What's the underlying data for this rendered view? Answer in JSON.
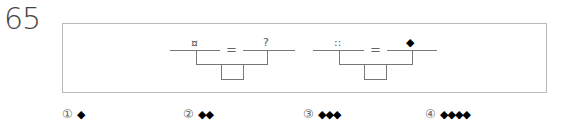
{
  "question": {
    "number": "65"
  },
  "diagrams": [
    {
      "left_symbol": "¤",
      "equals": "=",
      "right_symbol": "?"
    },
    {
      "left_symbol": "::",
      "equals": "=",
      "right_symbol": "◆"
    }
  ],
  "options": [
    {
      "marker": "①",
      "value": "◆"
    },
    {
      "marker": "②",
      "value": "◆◆"
    },
    {
      "marker": "③",
      "value": "◆◆◆"
    },
    {
      "marker": "④",
      "value": "◆◆◆◆"
    }
  ],
  "colors": {
    "frame_border": "#b8b8b8",
    "line": "#777777",
    "diamond": "#000000"
  }
}
